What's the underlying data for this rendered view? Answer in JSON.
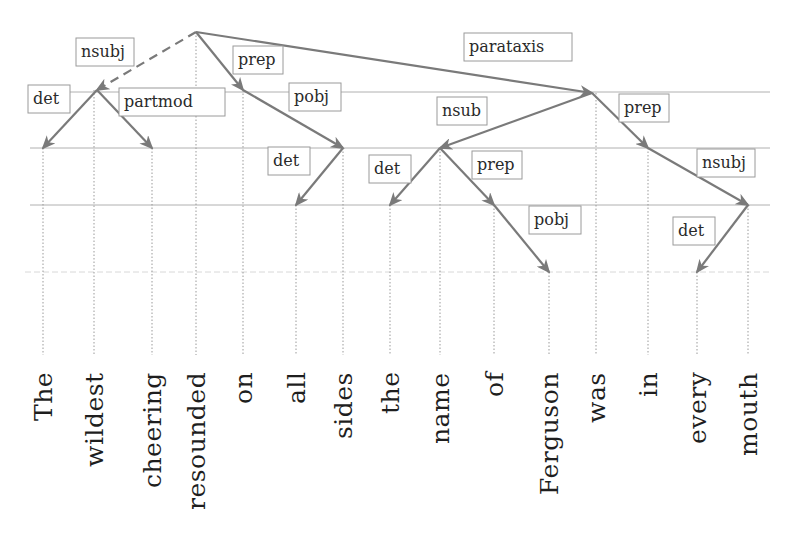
{
  "diagram": {
    "type": "dependency-parse-tree",
    "colors": {
      "edge": "#7a7a7a",
      "guide": "#b0b0b0",
      "label_border": "#9a9a9a",
      "text": "#1e1e1e"
    },
    "levels_y": [
      32,
      92,
      148,
      205,
      272
    ],
    "words": [
      {
        "text": "The",
        "x": 43
      },
      {
        "text": "wildest",
        "x": 94
      },
      {
        "text": "cheering",
        "x": 152
      },
      {
        "text": "resounded",
        "x": 196
      },
      {
        "text": "on",
        "x": 243
      },
      {
        "text": "all",
        "x": 296
      },
      {
        "text": "sides",
        "x": 343
      },
      {
        "text": "the",
        "x": 390
      },
      {
        "text": "name",
        "x": 440
      },
      {
        "text": "of",
        "x": 494
      },
      {
        "text": "Ferguson",
        "x": 549
      },
      {
        "text": "was",
        "x": 596
      },
      {
        "text": "in",
        "x": 648
      },
      {
        "text": "every",
        "x": 697
      },
      {
        "text": "mouth",
        "x": 748
      }
    ],
    "edges": [
      {
        "label": "nsubj",
        "from": "resounded",
        "to": "wildest",
        "dashed": true,
        "x1": 196,
        "y1": 32,
        "x2": 97,
        "y2": 90,
        "lx": 76,
        "ly": 38
      },
      {
        "label": "prep",
        "from": "resounded",
        "to": "on",
        "dashed": false,
        "x1": 196,
        "y1": 32,
        "x2": 243,
        "y2": 90,
        "lx": 233,
        "ly": 46
      },
      {
        "label": "parataxis",
        "from": "resounded",
        "to": "was",
        "dashed": false,
        "x1": 196,
        "y1": 32,
        "x2": 592,
        "y2": 93,
        "lx": 464,
        "ly": 33
      },
      {
        "label": "det",
        "from": "wildest",
        "to": "The",
        "dashed": false,
        "x1": 97,
        "y1": 90,
        "x2": 43,
        "y2": 148,
        "lx": 28,
        "ly": 85
      },
      {
        "label": "partmod",
        "from": "wildest",
        "to": "cheering",
        "dashed": false,
        "x1": 97,
        "y1": 90,
        "x2": 152,
        "y2": 148,
        "lx": 119,
        "ly": 88
      },
      {
        "label": "pobj",
        "from": "on",
        "to": "sides",
        "dashed": false,
        "x1": 243,
        "y1": 90,
        "x2": 343,
        "y2": 148,
        "lx": 289,
        "ly": 83
      },
      {
        "label": "det",
        "from": "sides",
        "to": "all",
        "dashed": false,
        "x1": 343,
        "y1": 148,
        "x2": 296,
        "y2": 205,
        "lx": 268,
        "ly": 147
      },
      {
        "label": "nsub",
        "from": "was",
        "to": "name",
        "dashed": false,
        "x1": 592,
        "y1": 93,
        "x2": 440,
        "y2": 148,
        "lx": 437,
        "ly": 97
      },
      {
        "label": "prep",
        "from": "was",
        "to": "in",
        "dashed": false,
        "x1": 592,
        "y1": 93,
        "x2": 648,
        "y2": 148,
        "lx": 619,
        "ly": 94
      },
      {
        "label": "det",
        "from": "name",
        "to": "the",
        "dashed": false,
        "x1": 440,
        "y1": 148,
        "x2": 390,
        "y2": 205,
        "lx": 369,
        "ly": 155
      },
      {
        "label": "prep",
        "from": "name",
        "to": "of",
        "dashed": false,
        "x1": 440,
        "y1": 148,
        "x2": 494,
        "y2": 205,
        "lx": 472,
        "ly": 151
      },
      {
        "label": "pobj",
        "from": "of",
        "to": "Ferguson",
        "dashed": false,
        "x1": 494,
        "y1": 205,
        "x2": 549,
        "y2": 272,
        "lx": 529,
        "ly": 206
      },
      {
        "label": "nsubj",
        "from": "in",
        "to": "mouth",
        "dashed": false,
        "x1": 648,
        "y1": 148,
        "x2": 748,
        "y2": 205,
        "lx": 697,
        "ly": 149
      },
      {
        "label": "det",
        "from": "mouth",
        "to": "every",
        "dashed": false,
        "x1": 748,
        "y1": 205,
        "x2": 697,
        "y2": 272,
        "lx": 673,
        "ly": 217
      }
    ],
    "label_widths": {
      "nsubj": 58,
      "prep": 50,
      "parataxis": 108,
      "det": 42,
      "partmod": 106,
      "pobj": 52,
      "nsub": 50
    }
  }
}
